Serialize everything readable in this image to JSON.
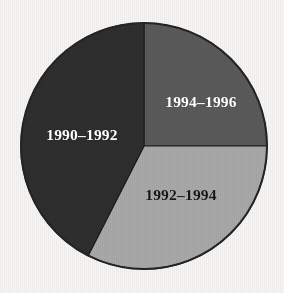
{
  "figure": {
    "background_color": "#f6f5f3",
    "outline_color": "#242424",
    "width": 284,
    "height": 293
  },
  "chart_data": {
    "type": "pie",
    "title": "",
    "subtitle": "",
    "xlabel": "",
    "ylabel": "",
    "grid": false,
    "legend_position": "none",
    "label_placement": "inside-slices",
    "start_angle_deg": 0,
    "direction": "clockwise",
    "center": {
      "x": 144,
      "y": 146
    },
    "radius": 123,
    "categories": [
      "1994–1996",
      "1992–1994",
      "1990–1992"
    ],
    "values": [
      25,
      32.5,
      42.5
    ],
    "value_unit": "percent",
    "slices": [
      {
        "label": "1994–1996",
        "value": 25,
        "color": "#5a5a5a",
        "start_angle_deg": 0,
        "end_angle_deg": 90,
        "label_color": "#ffffff",
        "label_x": 201,
        "label_y": 102
      },
      {
        "label": "1992–1994",
        "value": 32.5,
        "color": "#a8a8a8",
        "start_angle_deg": 90,
        "end_angle_deg": 207,
        "label_color": "#15161a",
        "label_x": 181,
        "label_y": 195
      },
      {
        "label": "1990–1992",
        "value": 42.5,
        "color": "#2e2e2e",
        "start_angle_deg": 207,
        "end_angle_deg": 360,
        "label_color": "#ffffff",
        "label_x": 82,
        "label_y": 135
      }
    ]
  }
}
